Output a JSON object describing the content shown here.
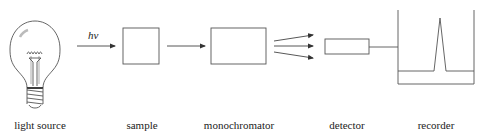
{
  "diagram": {
    "colors": {
      "stroke": "#555555",
      "text": "#222222",
      "background": "#ffffff"
    },
    "photon_label": "hν",
    "components": [
      {
        "id": "light-source",
        "label": "light source"
      },
      {
        "id": "sample",
        "label": "sample"
      },
      {
        "id": "monochromator",
        "label": "monochromator"
      },
      {
        "id": "detector",
        "label": "detector"
      },
      {
        "id": "recorder",
        "label": "recorder"
      }
    ]
  }
}
